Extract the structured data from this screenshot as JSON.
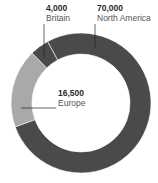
{
  "chart_data": {
    "type": "pie",
    "variant": "donut",
    "title": "",
    "categories": [
      "North America",
      "Europe",
      "Britain"
    ],
    "values": [
      70000,
      16500,
      4000
    ],
    "value_labels": [
      "70,000",
      "16,500",
      "4,000"
    ],
    "colors": [
      "#4a4a4a",
      "#a9a9a9",
      "#4a4a4a"
    ],
    "legend": "none (callout labels)",
    "center": [
      81,
      103
    ],
    "outer_radius": 70,
    "inner_radius": 49,
    "start_angle_deg": 250,
    "order_clockwise": [
      "Europe",
      "Britain",
      "North America"
    ]
  },
  "labels": {
    "britain": {
      "value": "4,000",
      "name": "Britain"
    },
    "north_america": {
      "value": "70,000",
      "name": "North America"
    },
    "europe": {
      "value": "16,500",
      "name": "Europe"
    }
  }
}
